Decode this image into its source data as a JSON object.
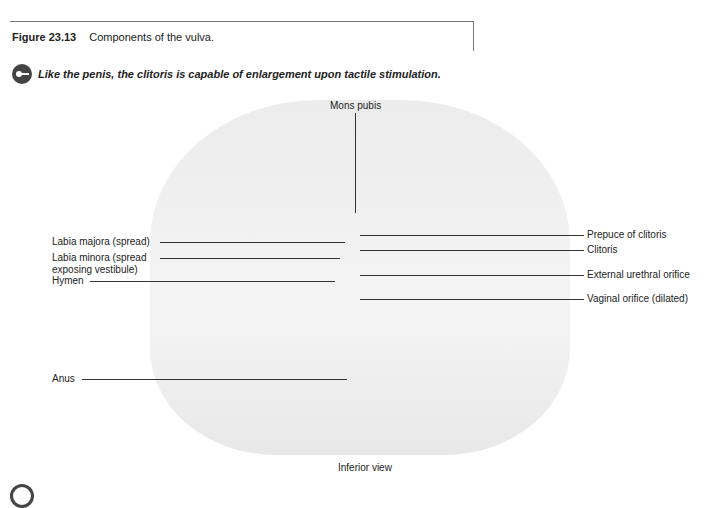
{
  "figure": {
    "number": "Figure 23.13",
    "caption": "Components of the vulva."
  },
  "note": {
    "icon": "key-icon",
    "text": "Like the penis, the clitoris is capable of enlargement upon tactile stimulation."
  },
  "labels": {
    "mons_pubis": "Mons pubis",
    "labia_majora": "Labia majora (spread)",
    "labia_minora_1": "Labia minora (spread",
    "labia_minora_2": "exposing vestibule)",
    "hymen": "Hymen",
    "anus": "Anus",
    "prepuce": "Prepuce of clitoris",
    "clitoris": "Clitoris",
    "urethral": "External urethral orifice",
    "vaginal": "Vaginal orifice (dilated)"
  },
  "view_label": "Inferior view"
}
